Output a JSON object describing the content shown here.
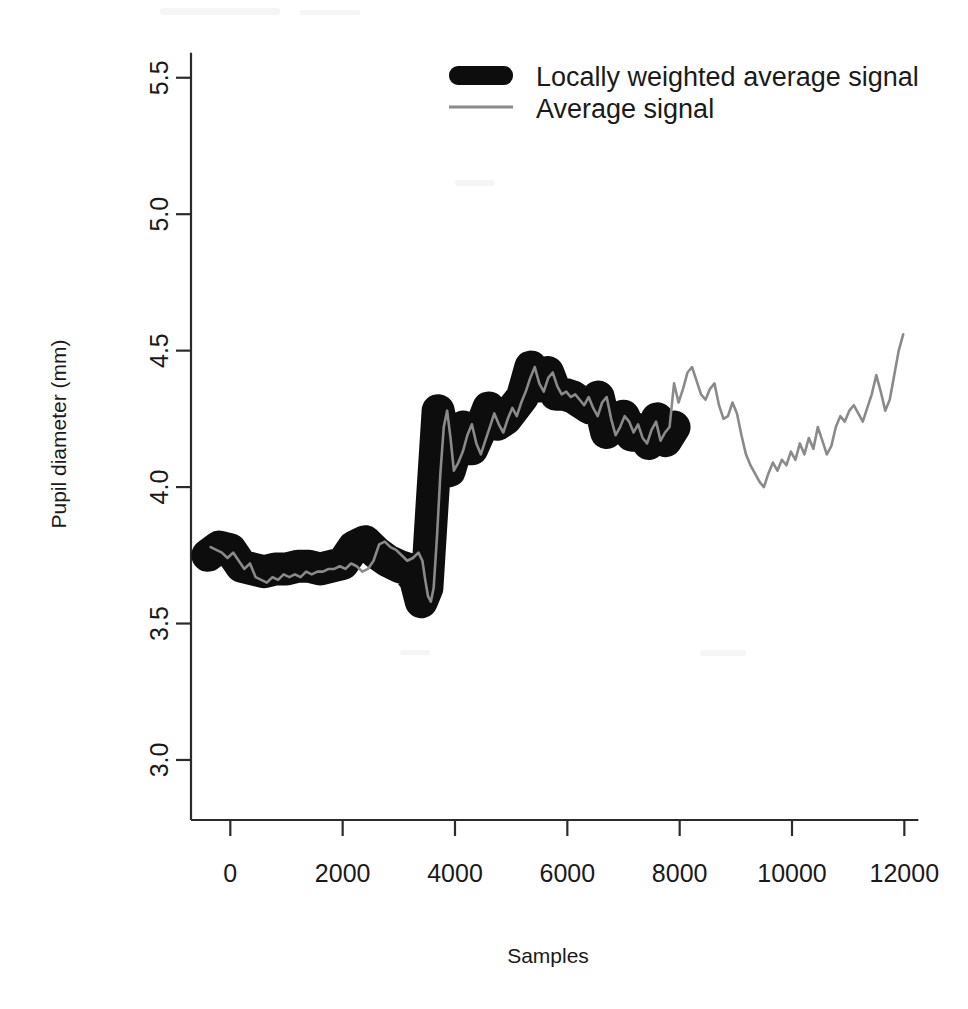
{
  "chart_data": {
    "type": "line",
    "title": "",
    "xlabel": "Samples",
    "ylabel": "Pupil diameter (mm)",
    "xlim": [
      -700,
      12350
    ],
    "ylim": [
      2.78,
      5.62
    ],
    "xticks": [
      0,
      2000,
      4000,
      6000,
      8000,
      10000,
      12000
    ],
    "xtick_labels": [
      "0",
      "2000",
      "4000",
      "6000",
      "8000",
      "10000",
      "12000"
    ],
    "yticks": [
      3.0,
      3.5,
      4.0,
      4.5,
      5.0,
      5.5
    ],
    "ytick_labels": [
      "3.0",
      "3.5",
      "4.0",
      "4.5",
      "5.0",
      "5.5"
    ],
    "grid": false,
    "legend_position": "top-right",
    "legend": [
      {
        "label": "Locally weighted average signal",
        "style": "thick",
        "color": "#0d0d0d",
        "width": 33
      },
      {
        "label": "Average signal",
        "style": "thin",
        "color": "#8a8a8a",
        "width": 2.6
      }
    ],
    "series": [
      {
        "name": "Locally weighted average signal",
        "style": "thick",
        "color": "#0d0d0d",
        "note": "Heavy smoothed envelope drawn from sample -400 to about 7900",
        "x": [
          -400,
          -200,
          0,
          200,
          400,
          600,
          800,
          1000,
          1200,
          1400,
          1600,
          1800,
          2000,
          2200,
          2400,
          2600,
          2800,
          3000,
          3150,
          3300,
          3400,
          3500,
          3600,
          3700,
          3800,
          3900,
          4000,
          4150,
          4300,
          4450,
          4600,
          4750,
          4900,
          5050,
          5200,
          5350,
          5500,
          5650,
          5800,
          5950,
          6100,
          6250,
          6400,
          6550,
          6700,
          6850,
          7000,
          7150,
          7300,
          7450,
          7600,
          7750,
          7900
        ],
        "y": [
          3.75,
          3.78,
          3.77,
          3.71,
          3.7,
          3.69,
          3.7,
          3.7,
          3.71,
          3.71,
          3.7,
          3.71,
          3.72,
          3.78,
          3.8,
          3.76,
          3.73,
          3.71,
          3.7,
          3.66,
          3.58,
          3.63,
          3.96,
          4.28,
          4.18,
          4.06,
          4.13,
          4.22,
          4.14,
          4.21,
          4.29,
          4.23,
          4.25,
          4.29,
          4.33,
          4.44,
          4.37,
          4.42,
          4.34,
          4.34,
          4.33,
          4.31,
          4.29,
          4.33,
          4.2,
          4.23,
          4.26,
          4.19,
          4.21,
          4.16,
          4.25,
          4.17,
          4.22
        ]
      },
      {
        "name": "Average signal",
        "style": "thin",
        "color": "#8a8a8a",
        "note": "Raw noisy trace spanning the whole record to sample 12000",
        "x": [
          -350,
          -250,
          -150,
          -50,
          50,
          150,
          250,
          350,
          450,
          550,
          650,
          750,
          850,
          950,
          1050,
          1150,
          1250,
          1350,
          1450,
          1550,
          1650,
          1750,
          1850,
          1950,
          2050,
          2150,
          2250,
          2350,
          2450,
          2550,
          2650,
          2750,
          2850,
          2950,
          3050,
          3150,
          3250,
          3350,
          3420,
          3470,
          3520,
          3570,
          3620,
          3680,
          3740,
          3800,
          3860,
          3920,
          3980,
          4060,
          4140,
          4220,
          4300,
          4380,
          4460,
          4540,
          4620,
          4700,
          4780,
          4860,
          4940,
          5020,
          5100,
          5180,
          5260,
          5340,
          5420,
          5500,
          5580,
          5660,
          5740,
          5820,
          5900,
          5980,
          6060,
          6140,
          6220,
          6300,
          6380,
          6460,
          6540,
          6620,
          6700,
          6780,
          6860,
          6940,
          7020,
          7100,
          7180,
          7260,
          7340,
          7420,
          7500,
          7580,
          7660,
          7740,
          7820,
          7900,
          7980,
          8060,
          8140,
          8220,
          8300,
          8380,
          8460,
          8540,
          8620,
          8700,
          8780,
          8860,
          8940,
          9020,
          9100,
          9180,
          9260,
          9340,
          9420,
          9500,
          9580,
          9660,
          9740,
          9820,
          9900,
          9980,
          10060,
          10140,
          10220,
          10300,
          10380,
          10460,
          10540,
          10620,
          10700,
          10780,
          10860,
          10940,
          11020,
          11100,
          11180,
          11260,
          11340,
          11420,
          11500,
          11580,
          11660,
          11740,
          11820,
          11900,
          11980
        ],
        "y": [
          3.78,
          3.77,
          3.76,
          3.74,
          3.76,
          3.73,
          3.7,
          3.72,
          3.67,
          3.66,
          3.65,
          3.67,
          3.66,
          3.68,
          3.67,
          3.68,
          3.67,
          3.69,
          3.68,
          3.69,
          3.69,
          3.7,
          3.7,
          3.71,
          3.7,
          3.72,
          3.71,
          3.69,
          3.7,
          3.73,
          3.79,
          3.8,
          3.78,
          3.77,
          3.75,
          3.73,
          3.74,
          3.76,
          3.73,
          3.66,
          3.6,
          3.58,
          3.63,
          3.82,
          4.05,
          4.22,
          4.28,
          4.18,
          4.06,
          4.09,
          4.13,
          4.19,
          4.23,
          4.16,
          4.12,
          4.17,
          4.22,
          4.27,
          4.23,
          4.2,
          4.25,
          4.29,
          4.26,
          4.31,
          4.35,
          4.4,
          4.44,
          4.38,
          4.35,
          4.4,
          4.42,
          4.37,
          4.34,
          4.35,
          4.33,
          4.34,
          4.32,
          4.3,
          4.33,
          4.29,
          4.26,
          4.31,
          4.33,
          4.25,
          4.19,
          4.22,
          4.26,
          4.24,
          4.2,
          4.23,
          4.18,
          4.16,
          4.21,
          4.24,
          4.17,
          4.2,
          4.22,
          4.38,
          4.31,
          4.36,
          4.42,
          4.44,
          4.39,
          4.34,
          4.32,
          4.36,
          4.38,
          4.3,
          4.25,
          4.26,
          4.31,
          4.27,
          4.19,
          4.12,
          4.08,
          4.05,
          4.02,
          4.0,
          4.05,
          4.09,
          4.06,
          4.1,
          4.08,
          4.13,
          4.1,
          4.16,
          4.12,
          4.18,
          4.14,
          4.22,
          4.17,
          4.12,
          4.15,
          4.22,
          4.26,
          4.24,
          4.28,
          4.3,
          4.27,
          4.24,
          4.29,
          4.34,
          4.41,
          4.35,
          4.28,
          4.32,
          4.41,
          4.5,
          4.56
        ]
      }
    ]
  },
  "figure": {
    "background": "#ffffff",
    "axis_color": "#2b2b2b",
    "text_color": "#1a1a1a"
  }
}
